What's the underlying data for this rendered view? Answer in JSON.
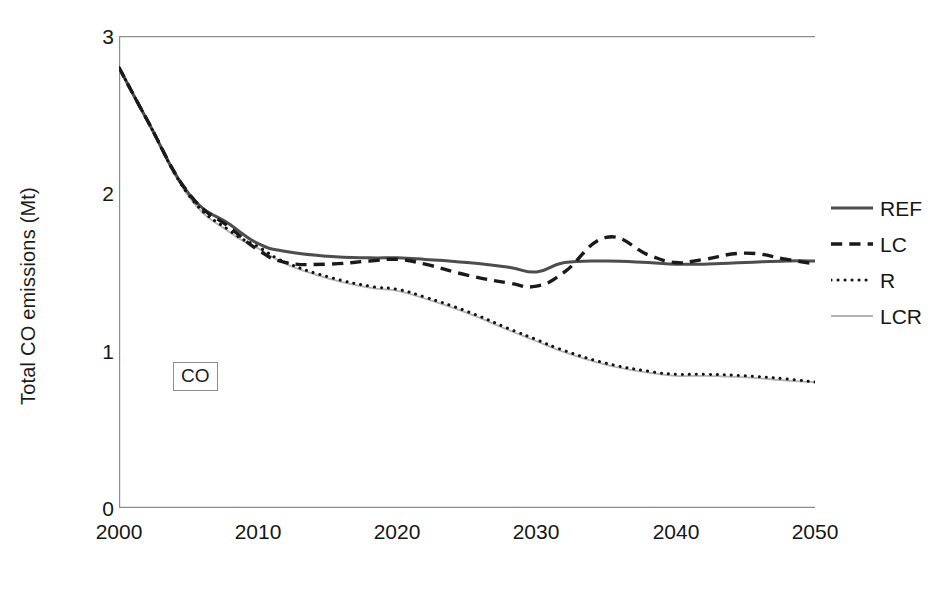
{
  "chart_data": {
    "type": "line",
    "title": "",
    "xlabel": "",
    "ylabel": "Total CO emissions (Mt)",
    "xlim": [
      2000,
      2050
    ],
    "ylim": [
      0,
      3
    ],
    "yticks": [
      0,
      1,
      2,
      3
    ],
    "xticks": [
      2000,
      2005,
      2010,
      2015,
      2020,
      2025,
      2030,
      2035,
      2040,
      2045,
      2050
    ],
    "xtick_labels": [
      "2000",
      "",
      "2010",
      "",
      "2020",
      "",
      "2030",
      "",
      "2040",
      "",
      "2050"
    ],
    "grid": false,
    "legend_position": "right",
    "annotations": [
      {
        "text": "CO",
        "x": 2008,
        "y": 1.03,
        "boxed": true
      }
    ],
    "x": [
      2000,
      2002,
      2005,
      2008,
      2010,
      2012,
      2015,
      2018,
      2020,
      2022,
      2025,
      2028,
      2030,
      2032,
      2035,
      2038,
      2040,
      2042,
      2045,
      2048,
      2050
    ],
    "series": [
      {
        "name": "REF",
        "style": "solid",
        "color": "#4d4d4d",
        "width": 3.0,
        "values": [
          2.8,
          2.47,
          2.0,
          1.8,
          1.68,
          1.63,
          1.6,
          1.59,
          1.59,
          1.58,
          1.56,
          1.53,
          1.5,
          1.56,
          1.57,
          1.56,
          1.55,
          1.55,
          1.56,
          1.57,
          1.57
        ]
      },
      {
        "name": "LC",
        "style": "dashed",
        "color": "#1a1a1a",
        "width": 3.4,
        "values": [
          2.8,
          2.47,
          2.0,
          1.78,
          1.64,
          1.56,
          1.55,
          1.57,
          1.58,
          1.55,
          1.48,
          1.43,
          1.41,
          1.5,
          1.72,
          1.61,
          1.56,
          1.58,
          1.62,
          1.58,
          1.55
        ]
      },
      {
        "name": "R",
        "style": "dotted",
        "color": "#111111",
        "width": 3.0,
        "values": [
          2.8,
          2.47,
          1.99,
          1.76,
          1.66,
          1.56,
          1.47,
          1.41,
          1.39,
          1.34,
          1.25,
          1.14,
          1.07,
          1.0,
          0.92,
          0.87,
          0.85,
          0.85,
          0.84,
          0.82,
          0.8
        ]
      },
      {
        "name": "LCR",
        "style": "solid-light",
        "color": "#b3b3b3",
        "width": 1.8,
        "values": [
          2.79,
          2.46,
          1.98,
          1.75,
          1.65,
          1.55,
          1.46,
          1.4,
          1.38,
          1.33,
          1.24,
          1.13,
          1.06,
          0.99,
          0.91,
          0.86,
          0.84,
          0.84,
          0.83,
          0.81,
          0.8
        ]
      }
    ]
  },
  "axis": {
    "y_labels": [
      "3",
      "2",
      "1",
      "0"
    ],
    "x_labels": [
      "2000",
      "2010",
      "2020",
      "2030",
      "2040",
      "2050"
    ],
    "y_title": "Total CO emissions (Mt)"
  },
  "legend": {
    "items": [
      {
        "label": "REF",
        "style": "solid",
        "color": "#4d4d4d"
      },
      {
        "label": "LC",
        "style": "dashed",
        "color": "#1a1a1a"
      },
      {
        "label": "R",
        "style": "dotted",
        "color": "#111111"
      },
      {
        "label": "LCR",
        "style": "solid-light",
        "color": "#b3b3b3"
      }
    ]
  },
  "annotation": {
    "label": "CO"
  },
  "colors": {
    "axis": "#8c8c8c",
    "text": "#161616",
    "ref": "#4d4d4d",
    "lc": "#1a1a1a",
    "r": "#111111",
    "lcr": "#b3b3b3"
  }
}
